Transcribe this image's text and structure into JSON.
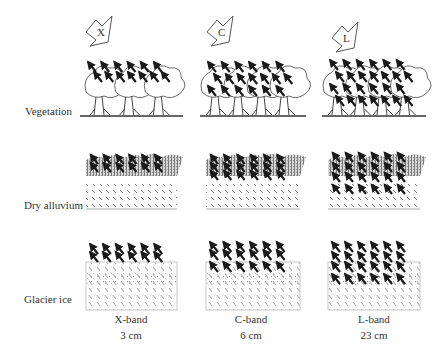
{
  "figure": {
    "rows": [
      {
        "id": "vegetation",
        "label": "Vegetation"
      },
      {
        "id": "dry-alluvium",
        "label": "Dry alluvium"
      },
      {
        "id": "glacier-ice",
        "label": "Glacier ice"
      }
    ],
    "columns": [
      {
        "id": "x-band",
        "radar_symbol": "X",
        "band_name": "X-band",
        "wavelength": "3 cm",
        "penetration": "low"
      },
      {
        "id": "c-band",
        "radar_symbol": "C",
        "band_name": "C-band",
        "wavelength": "6 cm",
        "penetration": "medium"
      },
      {
        "id": "l-band",
        "radar_symbol": "L",
        "band_name": "L-band",
        "wavelength": "23 cm",
        "penetration": "high"
      }
    ],
    "colors": {
      "ink": "#1a1a1a",
      "stipple": "#9a9a9a",
      "outline": "#555555",
      "background": "#ffffff"
    }
  }
}
